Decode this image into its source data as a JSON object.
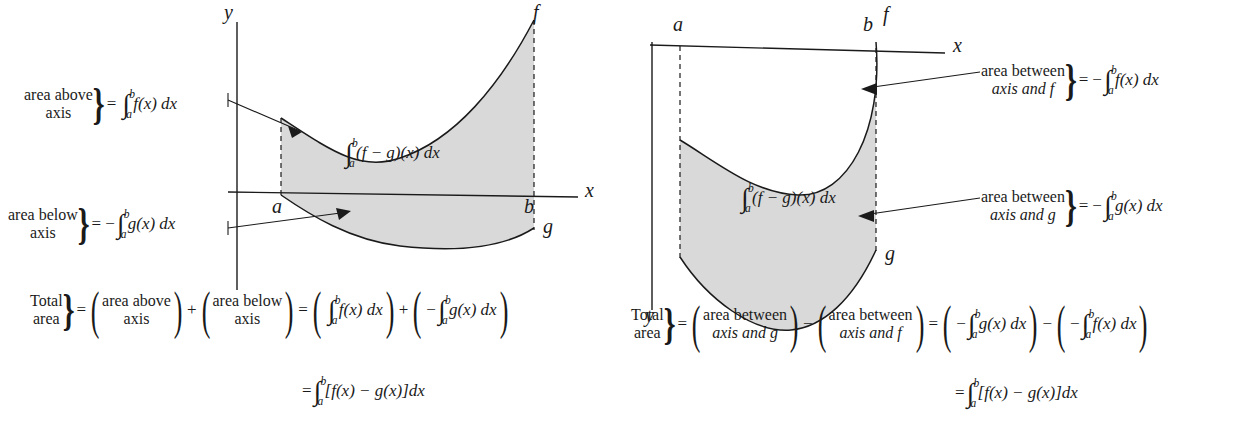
{
  "figure": {
    "type": "calculus-area-between-curves-diagram",
    "panels": [
      {
        "id": "left",
        "description": "f above the x-axis, g below the x-axis on [a,b]",
        "axis_labels": {
          "x": "x",
          "y": "y"
        },
        "curve_labels": {
          "f": "f",
          "g": "g"
        },
        "bound_labels": {
          "a": "a",
          "b": "b"
        },
        "region_label": "(f − g)(x) dx",
        "region_integral": {
          "symbol": "∫",
          "lower": "a",
          "upper": "b",
          "body": "(f − g)(x) dx"
        },
        "annotations": [
          {
            "name": "area-above-axis",
            "line1": "area above",
            "line2": "axis",
            "equals": "=",
            "sign": "",
            "integral": {
              "symbol": "∫",
              "lower": "a",
              "upper": "b",
              "body": "f(x) dx"
            }
          },
          {
            "name": "area-below-axis",
            "line1": "area below",
            "line2": "axis",
            "equals": "=",
            "sign": "−",
            "integral": {
              "symbol": "∫",
              "lower": "a",
              "upper": "b",
              "body": "g(x) dx"
            }
          }
        ],
        "summary": {
          "total_line1": "Total",
          "total_line2": "area",
          "eq1": "=",
          "term1": {
            "line1": "area above",
            "line2": "axis"
          },
          "op1": "+",
          "term2": {
            "line1": "area below",
            "line2": "axis"
          },
          "eq2": "=",
          "term3": {
            "sign": "",
            "integral": {
              "symbol": "∫",
              "lower": "a",
              "upper": "b",
              "body": "f(x) dx"
            }
          },
          "op2": "+",
          "term4": {
            "sign": "−",
            "integral": {
              "symbol": "∫",
              "lower": "a",
              "upper": "b",
              "body": "g(x) dx"
            }
          },
          "final_eq": "=",
          "final_integral": {
            "symbol": "∫",
            "lower": "a",
            "upper": "b",
            "body": "[f(x) − g(x)]dx"
          }
        }
      },
      {
        "id": "right",
        "description": "both f and g below the x-axis on [a,b]",
        "axis_labels": {
          "x": "x",
          "y": "y"
        },
        "curve_labels": {
          "f": "f",
          "g": "g"
        },
        "bound_labels": {
          "a": "a",
          "b": "b"
        },
        "region_integral": {
          "symbol": "∫",
          "lower": "a",
          "upper": "b",
          "body": "(f − g)(x) dx"
        },
        "annotations": [
          {
            "name": "area-between-axis-and-f",
            "line1": "area between",
            "line2": "axis and f",
            "equals": "=",
            "sign": "−",
            "integral": {
              "symbol": "∫",
              "lower": "a",
              "upper": "b",
              "body": "f(x) dx"
            }
          },
          {
            "name": "area-between-axis-and-g",
            "line1": "area between",
            "line2": "axis and g",
            "equals": "=",
            "sign": "−",
            "integral": {
              "symbol": "∫",
              "lower": "a",
              "upper": "b",
              "body": "g(x) dx"
            }
          }
        ],
        "summary": {
          "total_line1": "Total",
          "total_line2": "area",
          "eq1": "=",
          "term1": {
            "line1": "area between",
            "line2": "axis and g"
          },
          "op1": "−",
          "term2": {
            "line1": "area between",
            "line2": "axis and f"
          },
          "eq2": "=",
          "term3": {
            "sign": "−",
            "integral": {
              "symbol": "∫",
              "lower": "a",
              "upper": "b",
              "body": "g(x) dx"
            }
          },
          "op2": "−",
          "term4": {
            "sign": "−",
            "integral": {
              "symbol": "∫",
              "lower": "a",
              "upper": "b",
              "body": "f(x) dx"
            }
          },
          "final_eq": "=",
          "final_integral": {
            "symbol": "∫",
            "lower": "a",
            "upper": "b",
            "body": "[f(x) − g(x)]dx"
          }
        }
      }
    ],
    "colors": {
      "ink": "#1a1a1a",
      "shade_fill": "#d9d9d9",
      "curve": "#1a1a1a",
      "background": "#ffffff"
    }
  }
}
